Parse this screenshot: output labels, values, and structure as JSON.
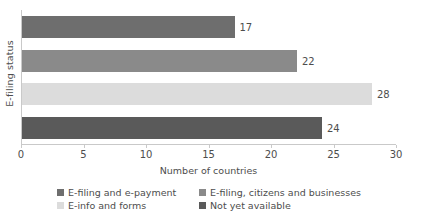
{
  "chart_data": {
    "type": "bar",
    "orientation": "horizontal",
    "title": "",
    "xlabel": "Number of countries",
    "ylabel": "E-filing status",
    "xlim": [
      0,
      30
    ],
    "xticks": [
      0,
      5,
      10,
      15,
      20,
      25,
      30
    ],
    "xtick_labels": [
      "0",
      "5",
      "10",
      "15",
      "20",
      "25",
      "30"
    ],
    "grid": false,
    "legend_position": "bottom",
    "categories": [
      "E-filing and e-payment",
      "E-filing, citizens and businesses",
      "E-info and forms",
      "Not yet available"
    ],
    "values": [
      17,
      22,
      28,
      24
    ],
    "value_labels": [
      "17",
      "22",
      "28",
      "24"
    ],
    "colors": [
      "#6e6e6e",
      "#8a8a8a",
      "#dcdcdc",
      "#5a5a5a"
    ],
    "bars": [
      {
        "label": "E-filing and e-payment",
        "value": 17,
        "value_label": "17",
        "color": "#6e6e6e"
      },
      {
        "label": "E-filing, citizens and businesses",
        "value": 22,
        "value_label": "22",
        "color": "#8a8a8a"
      },
      {
        "label": "E-info and forms",
        "value": 28,
        "value_label": "28",
        "color": "#dcdcdc"
      },
      {
        "label": "Not yet available",
        "value": 24,
        "value_label": "24",
        "color": "#5a5a5a"
      }
    ]
  },
  "legend": {
    "items": [
      {
        "label": "E-filing and e-payment",
        "color": "#6e6e6e"
      },
      {
        "label": "E-filing, citizens and businesses",
        "color": "#8a8a8a"
      },
      {
        "label": "E-info and forms",
        "color": "#dcdcdc"
      },
      {
        "label": "Not yet available",
        "color": "#5a5a5a"
      }
    ]
  },
  "axes": {
    "x_title": "Number of countries",
    "y_title": "E-filing status"
  }
}
